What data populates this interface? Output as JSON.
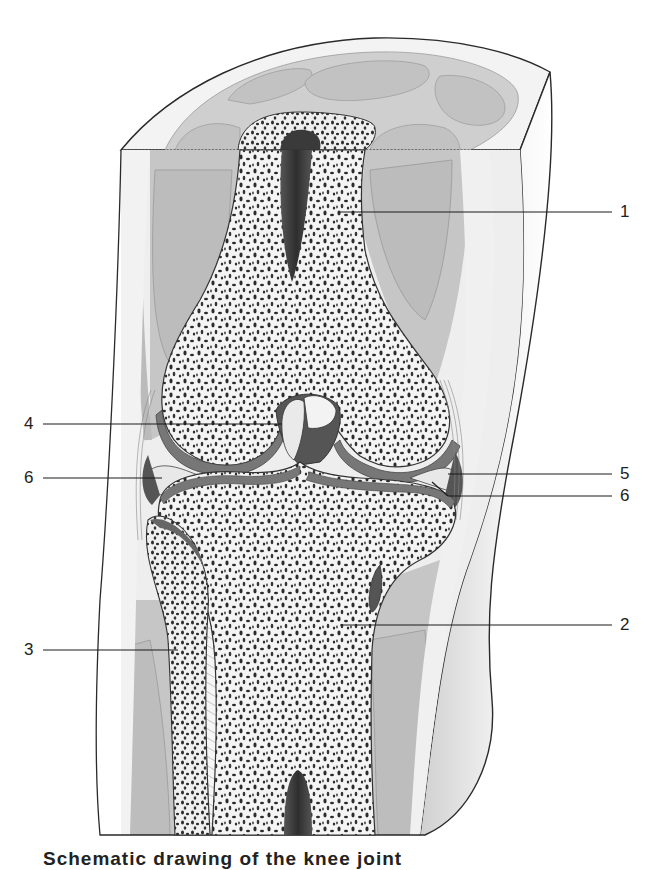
{
  "figure": {
    "caption": "Schematic drawing of the knee joint",
    "colors": {
      "skin_outline": "#2a2a2a",
      "subcutis": "#eeeeee",
      "muscle": "#bdbdbd",
      "muscle_light": "#cfcfcf",
      "bone_matrix": "#f4f4f4",
      "trabecula": "#2b2b2b",
      "marrow_cavity": "#3a3a3a",
      "cartilage": "#7a7a7a",
      "cartilage_dark": "#555555",
      "leader_line": "#1a1a1a"
    }
  },
  "labels": [
    {
      "id": "1",
      "text": "1",
      "side": "right",
      "line_from_x": 340,
      "line_to_x": 612,
      "y": 212,
      "text_x": 620
    },
    {
      "id": "2",
      "text": "2",
      "side": "right",
      "line_from_x": 340,
      "line_to_x": 612,
      "y": 625,
      "text_x": 620
    },
    {
      "id": "3",
      "text": "3",
      "side": "left",
      "line_from_x": 43,
      "line_to_x": 178,
      "y": 650,
      "text_x": 24
    },
    {
      "id": "4",
      "text": "4",
      "side": "left",
      "line_from_x": 43,
      "line_to_x": 282,
      "y": 424,
      "text_x": 24
    },
    {
      "id": "5",
      "text": "5",
      "side": "right",
      "line_from_x": 448,
      "line_to_x": 612,
      "y": 474,
      "text_x": 620
    },
    {
      "id": "6a",
      "text": "6",
      "side": "left",
      "line_from_x": 43,
      "line_to_x": 162,
      "y": 478,
      "text_x": 24
    },
    {
      "id": "6b",
      "text": "6",
      "side": "right",
      "line_from_x": 448,
      "line_to_x": 612,
      "y": 496,
      "text_x": 620
    }
  ]
}
